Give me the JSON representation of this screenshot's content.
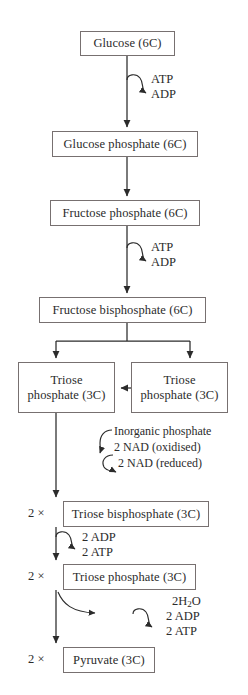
{
  "diagram": {
    "ink_color": "#2b2b2b",
    "box_border_color": "#777070",
    "background": "#ffffff",
    "boxes": [
      {
        "id": "glucose",
        "label": "Glucose (6C)"
      },
      {
        "id": "glucose_phosphate",
        "label": "Glucose phosphate (6C)"
      },
      {
        "id": "fructose_phosphate",
        "label": "Fructose phosphate (6C)"
      },
      {
        "id": "fructose_bisphosphate",
        "label": "Fructose bisphosphate (6C)"
      },
      {
        "id": "triose_phosphate_left",
        "line1": "Triose",
        "line2": "phosphate (3C)"
      },
      {
        "id": "triose_phosphate_right",
        "line1": "Triose",
        "line2": "phosphate (3C)"
      },
      {
        "id": "triose_bisphosphate",
        "label": "Triose bisphosphate (3C)"
      },
      {
        "id": "triose_phosphate_2x",
        "label": "Triose phosphate (3C)"
      },
      {
        "id": "pyruvate",
        "label": "Pyruvate (3C)"
      }
    ],
    "multipliers": {
      "triose_bisphosphate": "2  ×",
      "triose_phosphate_2x": "2  ×",
      "pyruvate": "2  ×"
    },
    "cofactors": {
      "step1_in": "ATP",
      "step1_out": "ADP",
      "step3_in": "ATP",
      "step3_out": "ADP",
      "step5_a": "Inorganic phosphate",
      "step5_b": "2 NAD (oxidised)",
      "step5_c": "2 NAD (reduced)",
      "step6_in": "2 ADP",
      "step6_out": "2 ATP",
      "step7_water": "2H",
      "step7_water_sub": "2",
      "step7_water_tail": "O",
      "step7_in": "2 ADP",
      "step7_out": "2 ATP"
    }
  }
}
